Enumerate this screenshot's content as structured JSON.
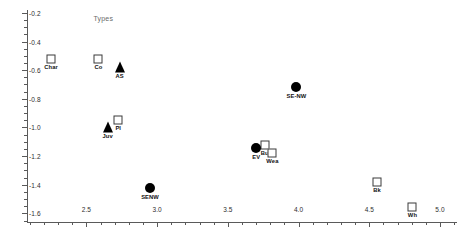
{
  "chart_data": {
    "type": "scatter",
    "title": "",
    "xlabel": "",
    "ylabel": "",
    "xlim": [
      2.08,
      5.12
    ],
    "ylim": [
      -1.66,
      -0.18
    ],
    "grid": false,
    "legend": "none",
    "annotations": [
      {
        "text": "Types",
        "x": 2.55,
        "y": -0.245
      }
    ],
    "xticks": [
      "2.5",
      "3.0",
      "3.5",
      "4.0",
      "4.5",
      "5.0"
    ],
    "xtick_values": [
      2.5,
      3.0,
      3.5,
      4.0,
      4.5,
      5.0
    ],
    "yticks": [
      "-0.2",
      "-0.4",
      "-0.6",
      "-0.8",
      "-1.0",
      "-1.2",
      "-1.4",
      "-1.6"
    ],
    "ytick_values": [
      -0.2,
      -0.4,
      -0.6,
      -0.8,
      -1.0,
      -1.2,
      -1.4,
      -1.6
    ],
    "points": [
      {
        "label": "Char",
        "x": 2.25,
        "y": -0.525,
        "marker": "open-square",
        "label_pos": "below"
      },
      {
        "label": "Co",
        "x": 2.585,
        "y": -0.525,
        "marker": "open-square",
        "label_pos": "below"
      },
      {
        "label": "AS",
        "x": 2.735,
        "y": -0.575,
        "marker": "filled-triangle",
        "label_pos": "below"
      },
      {
        "label": "SE-NW",
        "x": 3.985,
        "y": -0.715,
        "marker": "filled-circle",
        "label_pos": "below"
      },
      {
        "label": "Pl",
        "x": 2.725,
        "y": -0.95,
        "marker": "open-square",
        "label_pos": "below"
      },
      {
        "label": "Juv",
        "x": 2.65,
        "y": -0.995,
        "marker": "filled-triangle",
        "label_pos": "below"
      },
      {
        "label": "Bu",
        "x": 3.76,
        "y": -1.12,
        "marker": "open-square",
        "label_pos": "below"
      },
      {
        "label": "EV",
        "x": 3.7,
        "y": -1.14,
        "marker": "filled-circle",
        "label_pos": "below"
      },
      {
        "label": "Wea",
        "x": 3.815,
        "y": -1.175,
        "marker": "open-square",
        "label_pos": "below"
      },
      {
        "label": "Bk",
        "x": 4.555,
        "y": -1.38,
        "marker": "open-square",
        "label_pos": "below"
      },
      {
        "label": "SENW",
        "x": 2.95,
        "y": -1.42,
        "marker": "filled-circle",
        "label_pos": "below"
      },
      {
        "label": "Wh",
        "x": 4.805,
        "y": -1.552,
        "marker": "open-square",
        "label_pos": "below"
      }
    ]
  }
}
